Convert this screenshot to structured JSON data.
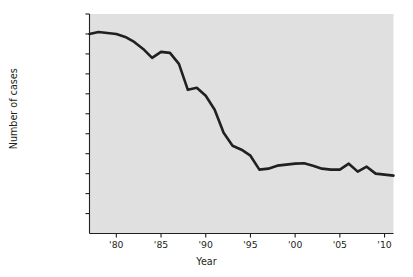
{
  "chart_data": {
    "type": "line",
    "title": "",
    "xlabel": "Year",
    "ylabel": "Number of cases",
    "grid": false,
    "legend": "none",
    "line_color": "#231f20",
    "plot_background": "#e0e0e0",
    "page_background": "#ffffff",
    "xlim": [
      1977,
      2011
    ],
    "ylim": [
      0,
      1100000
    ],
    "ytick_values": [
      1100000,
      1000000,
      900000,
      800000,
      700000,
      600000,
      500000,
      400000,
      300000,
      200000,
      100000
    ],
    "ytick_labels": [
      "1,100,000",
      "1,000,000",
      "900,000",
      "800,000",
      "700,000",
      "600,000",
      "500,000",
      "400,000",
      "300,000",
      "200,000",
      "100,000"
    ],
    "xtick_values": [
      1980,
      1985,
      1990,
      1995,
      2000,
      2005,
      2010
    ],
    "xtick_labels": [
      "'80",
      "'85",
      "'90",
      "'95",
      "'00",
      "'05",
      "'10"
    ],
    "x": [
      1977,
      1978,
      1979,
      1980,
      1981,
      1982,
      1983,
      1984,
      1985,
      1986,
      1987,
      1988,
      1989,
      1990,
      1991,
      1992,
      1993,
      1994,
      1995,
      1996,
      1997,
      1998,
      1999,
      2000,
      2001,
      2002,
      2003,
      2004,
      2005,
      2006,
      2007,
      2008,
      2009,
      2010,
      2011
    ],
    "values": [
      1000000,
      1010000,
      1005000,
      1000000,
      985000,
      960000,
      925000,
      880000,
      910000,
      905000,
      850000,
      720000,
      730000,
      690000,
      620000,
      505000,
      440000,
      420000,
      390000,
      320000,
      325000,
      340000,
      345000,
      350000,
      352000,
      340000,
      325000,
      320000,
      320000,
      350000,
      310000,
      335000,
      300000,
      295000,
      290000
    ],
    "series_name": "Number of cases"
  },
  "axes": {
    "y_axis_title": "Number of cases",
    "x_axis_title": "Year"
  }
}
